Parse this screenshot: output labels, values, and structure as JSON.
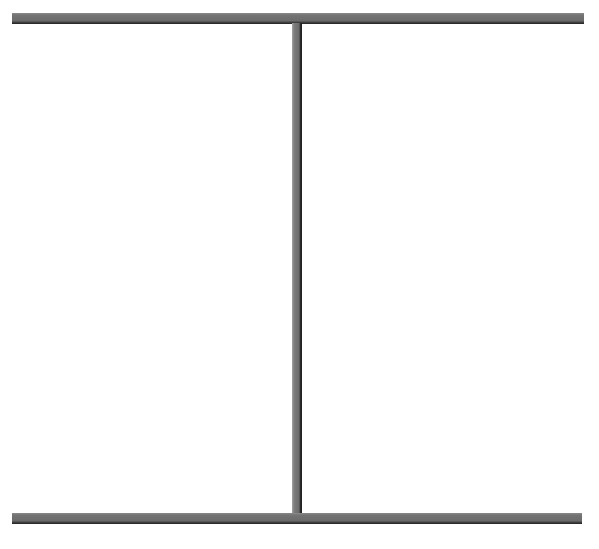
{
  "diagram": {
    "shape": "I-beam",
    "colors": {
      "bar_fill": "#6e6e6e",
      "bar_shadow": "#222222",
      "bar_highlight": "#a0a0a0",
      "background": "#ffffff"
    },
    "top_flange": {
      "x": 12,
      "y": 13,
      "width": 572,
      "height": 11
    },
    "web": {
      "x": 292,
      "y": 24,
      "width": 10,
      "height": 489
    },
    "bottom_flange": {
      "x": 12,
      "y": 513,
      "width": 570,
      "height": 11
    }
  }
}
